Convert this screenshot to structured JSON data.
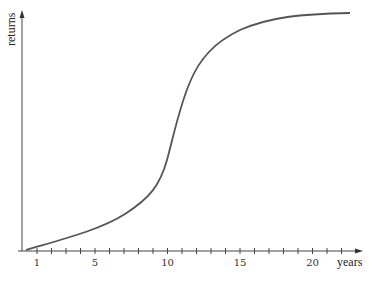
{
  "chart_data": {
    "type": "line",
    "title": "",
    "xlabel": "years",
    "ylabel": "returns",
    "x_ticks": [
      1,
      5,
      10,
      15,
      20
    ],
    "x_tick_labels": [
      "1",
      "5",
      "10",
      "15",
      "20"
    ],
    "minor_ticks_every": 1,
    "xlim": [
      0,
      22
    ],
    "ylim": [
      0,
      1
    ],
    "grid": false,
    "legend": null,
    "series": [
      {
        "name": "returns",
        "description": "S-shaped (logistic) growth curve",
        "x": [
          0.3,
          2,
          5,
          8,
          9.5,
          10.5,
          11.2,
          12,
          13,
          15,
          17,
          20,
          22.5
        ],
        "values": [
          0.0,
          0.05,
          0.12,
          0.23,
          0.33,
          0.47,
          0.6,
          0.75,
          0.84,
          0.93,
          0.97,
          0.99,
          1.0
        ]
      }
    ]
  },
  "axes": {
    "x_label": "years",
    "y_label": "returns"
  },
  "colors": {
    "curve": "#555555",
    "axis": "#444444",
    "text": "#333333"
  }
}
